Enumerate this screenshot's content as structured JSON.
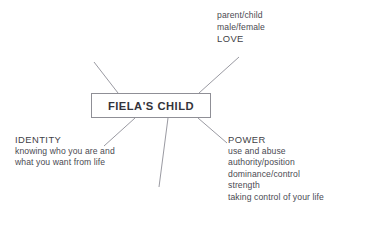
{
  "diagram": {
    "type": "mind-map",
    "center": {
      "label": "FIELA'S CHILD"
    },
    "branches": [
      {
        "id": "love",
        "heading": "LOVE",
        "position": "top-right",
        "items": [
          "parent/child",
          "male/female",
          "LOVE"
        ]
      },
      {
        "id": "identity",
        "heading": "IDENTITY",
        "position": "bottom-left",
        "items": [
          "IDENTITY",
          "knowing who you are and",
          "what you want from life"
        ]
      },
      {
        "id": "power",
        "heading": "POWER",
        "position": "bottom-right",
        "items": [
          "POWER",
          "use and abuse",
          "authority/position",
          "dominance/control",
          "strength",
          "taking control of your life"
        ]
      }
    ],
    "connectors": [
      {
        "id": "connector-top-left",
        "x1": 94,
        "y1": 62,
        "x2": 118,
        "y2": 93
      },
      {
        "id": "connector-top-right",
        "x1": 199,
        "y1": 93,
        "x2": 239,
        "y2": 57
      },
      {
        "id": "connector-bottom-left",
        "x1": 135,
        "y1": 118,
        "x2": 104,
        "y2": 146
      },
      {
        "id": "connector-bottom-center",
        "x1": 168,
        "y1": 118,
        "x2": 159,
        "y2": 187
      },
      {
        "id": "connector-bottom-right",
        "x1": 198,
        "y1": 118,
        "x2": 227,
        "y2": 143
      }
    ],
    "colors": {
      "background": "#ffffff",
      "text": "#4a4a52",
      "heading": "#3f3f47",
      "center_text": "#33333b",
      "line": "#9a9aa2",
      "box_border": "#8f8f96"
    }
  }
}
